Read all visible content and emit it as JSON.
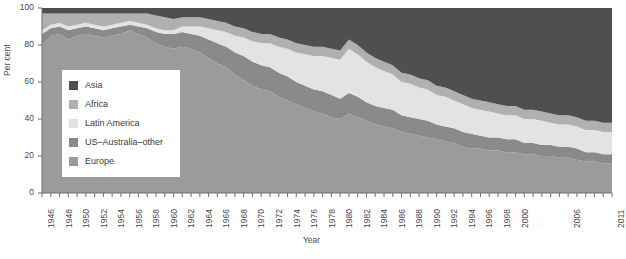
{
  "chart_data": {
    "type": "area",
    "title": "",
    "subtitle": "",
    "xlabel": "Year",
    "ylabel": "Per cent",
    "xlim": [
      1946,
      2011
    ],
    "ylim": [
      0,
      100
    ],
    "grid": false,
    "stacked": true,
    "stack_order_bottom_to_top": [
      "Europe",
      "US–Australia–other",
      "Latin America",
      "Africa",
      "Asia"
    ],
    "legend_position": "inside-left",
    "y_ticks": [
      0,
      20,
      40,
      60,
      80,
      100
    ],
    "x_ticks": [
      1946,
      1948,
      1950,
      1952,
      1954,
      1956,
      1958,
      1960,
      1962,
      1964,
      1966,
      1968,
      1970,
      1972,
      1974,
      1976,
      1978,
      1980,
      1982,
      1984,
      1986,
      1988,
      1990,
      1992,
      1994,
      1996,
      1998,
      2000,
      2006,
      2011
    ],
    "x": [
      1946,
      1947,
      1948,
      1949,
      1950,
      1951,
      1952,
      1953,
      1954,
      1955,
      1956,
      1957,
      1958,
      1959,
      1960,
      1961,
      1962,
      1963,
      1964,
      1965,
      1966,
      1967,
      1968,
      1969,
      1970,
      1971,
      1972,
      1973,
      1974,
      1975,
      1976,
      1977,
      1978,
      1979,
      1980,
      1981,
      1982,
      1983,
      1984,
      1985,
      1986,
      1987,
      1988,
      1989,
      1990,
      1991,
      1992,
      1993,
      1994,
      1995,
      1996,
      1997,
      1998,
      1999,
      2000,
      2001,
      2002,
      2003,
      2004,
      2005,
      2006,
      2007,
      2008,
      2009,
      2010,
      2011
    ],
    "series": [
      {
        "name": "Europe",
        "color": "#9b9b9b",
        "values": [
          80,
          85,
          86,
          83,
          85,
          86,
          85,
          84,
          85,
          86,
          88,
          86,
          84,
          81,
          79,
          78,
          79,
          78,
          76,
          73,
          70,
          68,
          64,
          61,
          58,
          56,
          55,
          52,
          50,
          48,
          46,
          44,
          43,
          41,
          40,
          43,
          41,
          39,
          37,
          36,
          35,
          33,
          32,
          31,
          30,
          29,
          28,
          27,
          25,
          24,
          24,
          23,
          23,
          22,
          22,
          21,
          21,
          20,
          20,
          19,
          19,
          18,
          17,
          17,
          16,
          16
        ]
      },
      {
        "name": "US–Australia–other",
        "color": "#8a8a8a",
        "values": [
          6,
          4,
          4,
          5,
          4,
          4,
          4,
          4,
          4,
          4,
          3,
          4,
          5,
          6,
          7,
          8,
          8,
          8,
          9,
          10,
          11,
          11,
          12,
          13,
          13,
          13,
          13,
          13,
          13,
          12,
          12,
          12,
          12,
          12,
          11,
          11,
          11,
          10,
          10,
          10,
          10,
          9,
          9,
          9,
          9,
          8,
          8,
          8,
          8,
          8,
          7,
          7,
          7,
          7,
          7,
          6,
          6,
          6,
          6,
          6,
          6,
          6,
          5,
          5,
          5,
          5
        ]
      },
      {
        "name": "Latin America",
        "color": "#e3e3e3",
        "values": [
          2,
          2,
          2,
          2,
          2,
          2,
          2,
          2,
          2,
          2,
          2,
          2,
          2,
          2,
          2,
          2,
          3,
          4,
          5,
          6,
          7,
          8,
          9,
          10,
          11,
          12,
          13,
          14,
          15,
          16,
          17,
          18,
          19,
          20,
          21,
          24,
          23,
          22,
          21,
          20,
          19,
          18,
          18,
          17,
          17,
          16,
          16,
          15,
          15,
          14,
          14,
          14,
          13,
          13,
          13,
          13,
          13,
          13,
          12,
          12,
          12,
          12,
          12,
          12,
          12,
          12
        ]
      },
      {
        "name": "Africa",
        "color": "#b0b0b0",
        "values": [
          9,
          6,
          5,
          7,
          6,
          5,
          6,
          7,
          6,
          5,
          4,
          5,
          6,
          7,
          7,
          6,
          5,
          5,
          5,
          5,
          5,
          5,
          5,
          5,
          5,
          5,
          5,
          5,
          5,
          5,
          5,
          5,
          5,
          5,
          5,
          5,
          5,
          5,
          5,
          5,
          5,
          5,
          5,
          5,
          5,
          5,
          5,
          5,
          5,
          5,
          5,
          5,
          5,
          5,
          5,
          5,
          5,
          5,
          5,
          5,
          5,
          5,
          5,
          5,
          5,
          5
        ]
      },
      {
        "name": "Asia",
        "color": "#4f4f4f",
        "values": [
          3,
          3,
          3,
          3,
          3,
          3,
          3,
          3,
          3,
          3,
          3,
          3,
          3,
          4,
          5,
          6,
          5,
          5,
          5,
          6,
          7,
          8,
          10,
          11,
          13,
          14,
          14,
          16,
          17,
          19,
          20,
          21,
          21,
          22,
          23,
          17,
          20,
          24,
          27,
          29,
          31,
          35,
          36,
          38,
          39,
          42,
          43,
          45,
          47,
          49,
          50,
          51,
          52,
          53,
          53,
          55,
          55,
          56,
          57,
          58,
          58,
          59,
          61,
          61,
          62,
          62
        ]
      }
    ]
  },
  "legend": {
    "items": [
      {
        "label": "Asia",
        "color": "#4f4f4f"
      },
      {
        "label": "Africa",
        "color": "#b0b0b0"
      },
      {
        "label": "Latin America",
        "color": "#e3e3e3"
      },
      {
        "label": "US–Australia–other",
        "color": "#8a8a8a"
      },
      {
        "label": "Europe",
        "color": "#9b9b9b"
      }
    ]
  },
  "axes": {
    "y_title": "Per cent",
    "x_title": "Year"
  }
}
